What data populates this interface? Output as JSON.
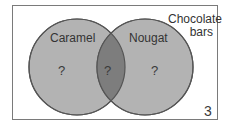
{
  "diagram": {
    "type": "venn",
    "universe_label_line1": "Chocolate",
    "universe_label_line2": "bars",
    "sets": [
      {
        "name": "Caramel",
        "only_value": "?"
      },
      {
        "name": "Nougat",
        "only_value": "?"
      }
    ],
    "intersection_value": "?",
    "outside_value": "3",
    "colors": {
      "circle_fill": "#b3b3b3",
      "intersection_fill": "#7d7d7d",
      "stroke": "#555555",
      "frame": "#7a7a7a"
    }
  }
}
